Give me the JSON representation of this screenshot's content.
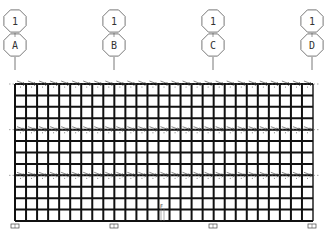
{
  "drawing": {
    "type": "structural-elevation-grid",
    "axes": [
      {
        "top": "1",
        "bottom": "A",
        "x": 15
      },
      {
        "top": "1",
        "bottom": "B",
        "x": 114
      },
      {
        "top": "1",
        "bottom": "C",
        "x": 213
      },
      {
        "top": "1",
        "bottom": "D",
        "x": 312
      }
    ],
    "grid": {
      "left": 15,
      "right": 313,
      "top": 84,
      "bottom": 221,
      "columns": 27,
      "rows": 12,
      "tie_rows": [
        0,
        4,
        8
      ]
    },
    "supports_x": [
      15,
      114,
      213,
      312
    ],
    "center_mark": "F",
    "colors": {
      "line": "#111111",
      "bubble": "#555555",
      "background": "#ffffff"
    }
  }
}
